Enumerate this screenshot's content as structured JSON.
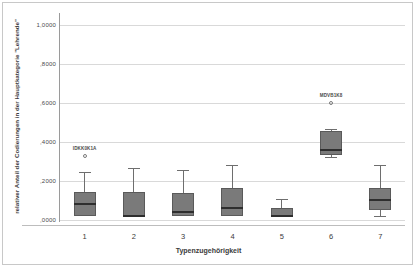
{
  "chart_data": {
    "type": "box",
    "title": "",
    "xlabel": "Typenzugehörigkeit",
    "ylabel": "relativer Anteil der Codierungen in der Hauptkategorie \"Lehrende\"",
    "categories": [
      "1",
      "2",
      "3",
      "4",
      "5",
      "6",
      "7"
    ],
    "ylim": [
      0.0,
      1.05
    ],
    "yticks": [
      {
        "value": 1.0,
        "label": "1,0000"
      },
      {
        "value": 0.8,
        "label": ",8000"
      },
      {
        "value": 0.6,
        "label": ",6000"
      },
      {
        "value": 0.4,
        "label": ",4000"
      },
      {
        "value": 0.2,
        "label": ",2000"
      },
      {
        "value": 0.0,
        "label": ",0000"
      }
    ],
    "grid": true,
    "legend": "none",
    "boxes": [
      {
        "category": "1",
        "whisker_low": 0.021,
        "q1": 0.021,
        "median": 0.084,
        "q3": 0.142,
        "whisker_high": 0.247,
        "outliers": [
          {
            "value": 0.326,
            "label": "IDKK0K1A"
          }
        ]
      },
      {
        "category": "2",
        "whisker_low": 0.021,
        "q1": 0.021,
        "median": 0.021,
        "q3": 0.142,
        "whisker_high": 0.268,
        "outliers": []
      },
      {
        "category": "3",
        "whisker_low": 0.021,
        "q1": 0.021,
        "median": 0.042,
        "q3": 0.137,
        "whisker_high": 0.258,
        "outliers": []
      },
      {
        "category": "4",
        "whisker_low": 0.021,
        "q1": 0.021,
        "median": 0.063,
        "q3": 0.163,
        "whisker_high": 0.284,
        "outliers": []
      },
      {
        "category": "5",
        "whisker_low": 0.021,
        "q1": 0.021,
        "median": 0.021,
        "q3": 0.063,
        "whisker_high": 0.11,
        "outliers": []
      },
      {
        "category": "6",
        "whisker_low": 0.321,
        "q1": 0.332,
        "median": 0.358,
        "q3": 0.458,
        "whisker_high": 0.468,
        "outliers": [
          {
            "value": 0.6,
            "label": "MDVB1K8"
          }
        ]
      },
      {
        "category": "7",
        "whisker_low": 0.021,
        "q1": 0.053,
        "median": 0.1,
        "q3": 0.163,
        "whisker_high": 0.284,
        "outliers": []
      }
    ],
    "colors": {
      "box_fill": "#7a7a7a",
      "box_edge": "#5a5a5a",
      "median": "#2e2e2e",
      "whisker": "#6e6e6e",
      "gridline": "#d9d9d9",
      "axis": "#9a9a9a",
      "text": "#3b3b3b",
      "background": "#ffffff",
      "frame": "#c8c8c8"
    }
  }
}
